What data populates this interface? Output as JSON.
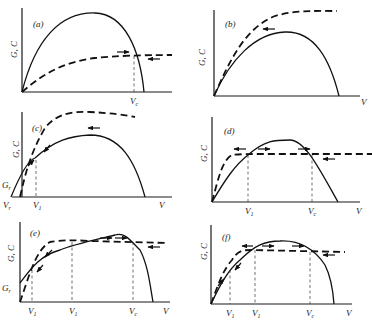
{
  "figure": {
    "y_axis_label": "G, C",
    "x_axis_label": "V",
    "legend": {
      "solid": "G (solid curve)",
      "dashed": "C (dashed curve)"
    },
    "panels": [
      {
        "id": "a",
        "label": "(a)",
        "x_ticks": [
          {
            "main": "V",
            "sub": "c"
          }
        ],
        "y_ticks": [],
        "show_x_label": false
      },
      {
        "id": "b",
        "label": "(b)",
        "x_ticks": [],
        "y_ticks": [],
        "show_x_label": true
      },
      {
        "id": "c",
        "label": "(c)",
        "x_ticks": [
          {
            "main": "V",
            "sub": "r"
          },
          {
            "main": "V",
            "sub": "1"
          }
        ],
        "y_ticks": [
          {
            "main": "G",
            "sub": "r"
          }
        ],
        "show_x_label": true
      },
      {
        "id": "d",
        "label": "(d)",
        "x_ticks": [
          {
            "main": "V",
            "sub": "1"
          },
          {
            "main": "V",
            "sub": "c"
          }
        ],
        "y_ticks": [],
        "show_x_label": true
      },
      {
        "id": "e",
        "label": "(e)",
        "x_ticks": [
          {
            "main": "V",
            "sub": "1"
          },
          {
            "main": "V",
            "sub": "1"
          },
          {
            "main": "V",
            "sub": "c"
          }
        ],
        "y_ticks": [
          {
            "main": "G",
            "sub": "r"
          }
        ],
        "show_x_label": true
      },
      {
        "id": "f",
        "label": "(f)",
        "x_ticks": [
          {
            "main": "V",
            "sub": "1"
          },
          {
            "main": "V",
            "sub": "1"
          },
          {
            "main": "V",
            "sub": "c"
          }
        ],
        "y_ticks": [],
        "show_x_label": true
      }
    ]
  },
  "labels": {
    "a": {
      "panel": "(a)",
      "y": "G, C",
      "vc": "V",
      "vc_sub": "c"
    },
    "b": {
      "panel": "(b)",
      "y": "G, C",
      "x": "V"
    },
    "c": {
      "panel": "(c)",
      "y": "G, C",
      "gr": "G",
      "gr_sub": "r",
      "vr": "V",
      "vr_sub": "r",
      "v1": "V",
      "v1_sub": "1",
      "x": "V"
    },
    "d": {
      "panel": "(d)",
      "y": "G, C",
      "v1": "V",
      "v1_sub": "1",
      "vc": "V",
      "vc_sub": "c",
      "x": "V"
    },
    "e": {
      "panel": "(e)",
      "y": "G, C",
      "gr": "G",
      "gr_sub": "r",
      "v1a": "V",
      "v1a_sub": "1",
      "v1b": "V",
      "v1b_sub": "1",
      "vc": "V",
      "vc_sub": "c",
      "x": "V"
    },
    "f": {
      "panel": "(f)",
      "y": "G, C",
      "v1a": "V",
      "v1a_sub": "1",
      "v1b": "V",
      "v1b_sub": "1",
      "vc": "V",
      "vc_sub": "c",
      "x": "V"
    }
  }
}
